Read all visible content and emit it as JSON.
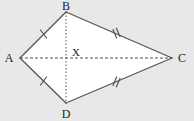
{
  "figure": {
    "type": "geometry-diagram",
    "shape_name": "kite",
    "background_color": "#e8e8e8",
    "fill_color": "#ffffff",
    "stroke_color": "#555555",
    "label_color": "#1d1d1d",
    "canvas": {
      "width": 194,
      "height": 121
    },
    "vertices": [
      {
        "id": "A",
        "label": "A",
        "x": 20,
        "y": 58,
        "label_x": 9,
        "label_y": 62
      },
      {
        "id": "B",
        "label": "B",
        "x": 66,
        "y": 12,
        "label_x": 63,
        "label_y": 10
      },
      {
        "id": "C",
        "label": "C",
        "x": 172,
        "y": 58,
        "label_x": 178,
        "label_y": 62
      },
      {
        "id": "D",
        "label": "D",
        "x": 66,
        "y": 103,
        "label_x": 63,
        "label_y": 117
      }
    ],
    "intersection": {
      "id": "X",
      "label": "X",
      "x": 66,
      "y": 58,
      "label_x": 70,
      "label_y": 55
    },
    "sides": [
      {
        "id": "AB",
        "from": "A",
        "to": "B",
        "tick_count": 1,
        "style": "solid"
      },
      {
        "id": "BC",
        "from": "B",
        "to": "C",
        "tick_count": 2,
        "style": "solid"
      },
      {
        "id": "CD",
        "from": "C",
        "to": "D",
        "tick_count": 2,
        "style": "solid"
      },
      {
        "id": "DA",
        "from": "D",
        "to": "A",
        "tick_count": 1,
        "style": "solid"
      }
    ],
    "diagonals": [
      {
        "id": "AC",
        "from": "A",
        "to": "C",
        "style": "dashed"
      },
      {
        "id": "BD",
        "from": "B",
        "to": "D",
        "style": "dotted"
      }
    ]
  }
}
